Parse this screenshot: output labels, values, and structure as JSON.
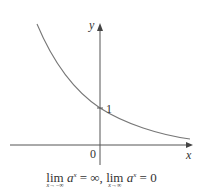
{
  "diagram": {
    "title": "",
    "axes": {
      "x_label": "x",
      "y_label": "y",
      "origin_label": "0"
    },
    "curve": {
      "type": "exponential decay",
      "equation": "y = a^x, 0 < a < 1",
      "y_intercept_label": "1"
    },
    "caption": {
      "lim1": "lim",
      "lim1_sub": "x→−∞",
      "expr1_base": "a",
      "expr1_exp": "x",
      "expr1_rhs": " = ∞,",
      "lim2": "lim",
      "lim2_sub": "x→∞",
      "expr2_base": "a",
      "expr2_exp": "x",
      "expr2_rhs": " = 0"
    },
    "colors": {
      "axis": "#444444",
      "curve": "#777777",
      "text": "#333333"
    }
  }
}
